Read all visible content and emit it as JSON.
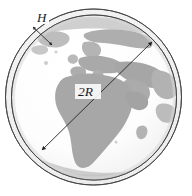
{
  "figure": {
    "canvas": {
      "width": 192,
      "height": 196,
      "background": "#ffffff"
    },
    "labels": {
      "atmosphere_thickness": "H",
      "diameter": "2R"
    },
    "colors": {
      "outline": "#3a3a3a",
      "ocean": "#fbfbfb",
      "land": "#a9a9a9",
      "land_light": "#c2c2c2",
      "shell_fill": "#f3f3f3",
      "arrow": "#222222",
      "label": "#1a1a1a"
    },
    "geometry": {
      "outer_circle": {
        "cx": 93.5,
        "cy": 97.0,
        "r": 88.0
      },
      "inner_circle": {
        "cx": 94.0,
        "cy": 97.5,
        "r": 82.5
      },
      "diameter_arrow": {
        "x1": 42.0,
        "y1": 150.0,
        "x2": 152.0,
        "y2": 42.0
      },
      "thickness_arrow": {
        "x1": 33.0,
        "y1": 27.0,
        "x2": 52.0,
        "y2": 45.0
      },
      "label_H_pos": {
        "x": 41.0,
        "y": 22.0
      },
      "label_2R_pos": {
        "x": 78.0,
        "y": 96.0
      }
    },
    "annotations": [
      {
        "name": "atmosphere-thickness-label",
        "text": "H",
        "meaning": "atmosphere shell thickness"
      },
      {
        "name": "earth-diameter-label",
        "text": "2R",
        "meaning": "Earth diameter, twice the radius"
      }
    ],
    "map_view": "Europe, Africa and the Middle East hemisphere"
  }
}
